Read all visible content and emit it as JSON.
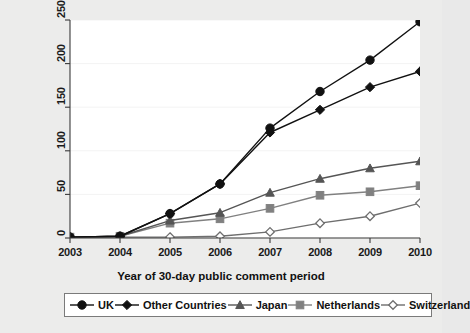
{
  "chart_data": {
    "type": "line",
    "title": "",
    "xlabel": "Year of 30-day public comment period",
    "ylabel": "Million CERs",
    "x": [
      2003,
      2004,
      2005,
      2006,
      2007,
      2008,
      2009,
      2010
    ],
    "categories": [
      "2003",
      "2004",
      "2005",
      "2006",
      "2007",
      "2008",
      "2009",
      "2010"
    ],
    "xlim": [
      2003,
      2010
    ],
    "ylim": [
      0,
      250
    ],
    "yticks": [
      0,
      50,
      100,
      150,
      200,
      250
    ],
    "ytick_labels": [
      "0",
      "50",
      "100",
      "150",
      "200",
      "250"
    ],
    "grid": true,
    "legend_position": "bottom",
    "series": [
      {
        "name": "UK",
        "marker": "filled-circle",
        "color": "#111111",
        "values": [
          1,
          2,
          28,
          62,
          126,
          168,
          204,
          248
        ]
      },
      {
        "name": "Other Countries",
        "marker": "filled-diamond",
        "color": "#111111",
        "values": [
          1,
          2,
          28,
          62,
          121,
          147,
          173,
          191
        ]
      },
      {
        "name": "Japan",
        "marker": "filled-triangle",
        "color": "#555555",
        "values": [
          1,
          2,
          20,
          29,
          52,
          68,
          80,
          88
        ]
      },
      {
        "name": "Netherlands",
        "marker": "filled-square",
        "color": "#808080",
        "values": [
          1,
          2,
          17,
          22,
          34,
          49,
          53,
          60
        ]
      },
      {
        "name": "Switzerland",
        "marker": "open-diamond",
        "color": "#6e6e6e",
        "values": [
          1,
          1,
          1,
          2,
          7,
          17,
          25,
          40
        ]
      }
    ]
  },
  "axes": {
    "ylabel": "Million CERs",
    "xlabel": "Year of 30-day public comment period"
  },
  "legend": {
    "items": [
      {
        "label": "UK"
      },
      {
        "label": "Other Countries"
      },
      {
        "label": "Japan"
      },
      {
        "label": "Netherlands"
      },
      {
        "label": "Switzerland"
      }
    ]
  },
  "colors": {
    "background": "#ececeb",
    "plot_background": "#ffffff",
    "axis": "#3a3a3a",
    "grid": "#f3f3f3",
    "legend_border": "#7a7a7a"
  }
}
